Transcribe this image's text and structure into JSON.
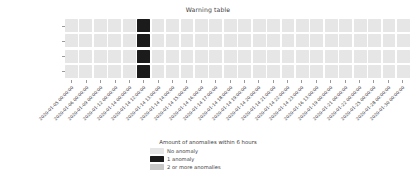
{
  "chart_data": {
    "type": "heatmap",
    "title": "Warning table",
    "xlabel": "",
    "ylabel": "",
    "grid": false,
    "legend_position": "bottom-center",
    "legend_title": "Amount of anomalies within 6 hours",
    "categories_y": [
      "HYDR_heading_status",
      "HYDR_heave_status",
      "HYDR_roll_status",
      "HYDR_pitch_status"
    ],
    "categories_x": [
      "2020-01-05 00:00:00",
      "2020-01-06 00:00:00",
      "2020-01-09 00:00:00",
      "2020-01-12 00:00:00",
      "2020-01-14 00:00:00",
      "2020-01-14 12:00:00",
      "2020-01-14 13:00:00",
      "2020-01-14 14:00:00",
      "2020-01-14 15:00:00",
      "2020-01-14 16:00:00",
      "2020-01-14 17:00:00",
      "2020-01-14 18:00:00",
      "2020-01-14 19:00:00",
      "2020-01-14 20:00:00",
      "2020-01-14 21:00:00",
      "2020-01-14 22:00:00",
      "2020-01-14 23:00:00",
      "2020-01-16 13:00:00",
      "2020-01-19 00:00:00",
      "2020-01-21 00:00:00",
      "2020-01-22 00:00:00",
      "2020-01-25 00:00:00",
      "2020-01-28 00:00:00",
      "2020-01-30 00:00:00"
    ],
    "value_labels": [
      "No anomaly",
      "1 anomaly",
      "2 or more anomalies"
    ],
    "value_colors": [
      "#e6e6e6",
      "#1b1b1b",
      "#c8c8c8"
    ],
    "values": [
      [
        0,
        0,
        0,
        0,
        0,
        1,
        0,
        0,
        0,
        0,
        0,
        0,
        0,
        0,
        0,
        0,
        0,
        0,
        0,
        0,
        0,
        0,
        0,
        0
      ],
      [
        0,
        0,
        0,
        0,
        0,
        1,
        0,
        0,
        0,
        0,
        0,
        0,
        0,
        0,
        0,
        0,
        0,
        0,
        0,
        0,
        0,
        0,
        0,
        0
      ],
      [
        0,
        0,
        0,
        0,
        0,
        1,
        0,
        0,
        0,
        0,
        0,
        0,
        0,
        0,
        0,
        0,
        0,
        0,
        0,
        0,
        0,
        0,
        0,
        0
      ],
      [
        0,
        0,
        0,
        0,
        0,
        1,
        0,
        0,
        0,
        0,
        0,
        0,
        0,
        0,
        0,
        0,
        0,
        0,
        0,
        0,
        0,
        0,
        0,
        0
      ]
    ]
  },
  "legend": {
    "title": "Amount of anomalies within 6 hours",
    "entries": [
      {
        "label": "No anomaly",
        "color": "#e6e6e6",
        "key": "none"
      },
      {
        "label": "1 anomaly",
        "color": "#1b1b1b",
        "key": "one"
      },
      {
        "label": "2 or more anomalies",
        "color": "#c8c8c8",
        "key": "many"
      }
    ]
  }
}
